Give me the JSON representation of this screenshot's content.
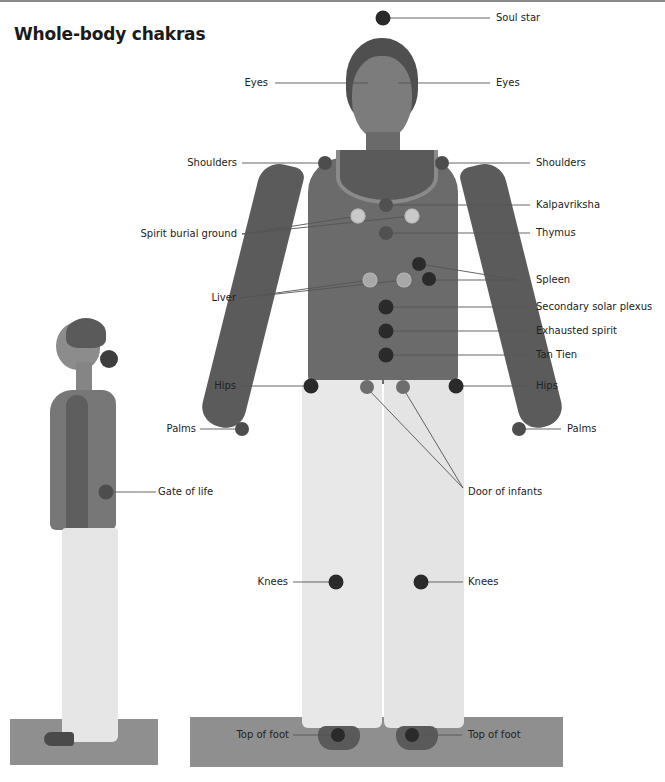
{
  "page": {
    "title": "Whole-body chakras"
  },
  "colors": {
    "dot_dark": "#2a2a2a",
    "dot_mid": "#4d4d4d",
    "dot_light": "#c9c9c9",
    "leader_line": "#555555",
    "mat": "#8f8f8f",
    "skin": "#5e5e5e",
    "top": "#6a6a6a",
    "trousers": "#e6e6e6"
  },
  "figures": {
    "front": "front-view-standing-woman",
    "side": "side-view-standing-woman"
  },
  "labels": {
    "soul_star": "Soul star",
    "eyes_left": "Eyes",
    "eyes_right": "Eyes",
    "shoulders_left": "Shoulders",
    "shoulders_right": "Shoulders",
    "kalpavriksha": "Kalpavriksha",
    "spirit_burial_ground": "Spirit burial ground",
    "thymus": "Thymus",
    "spleen": "Spleen",
    "liver": "Liver",
    "secondary_solar_plexus": "Secondary solar plexus",
    "exhausted_spirit": "Exhausted spirit",
    "tan_tien": "Tan Tien",
    "hips_left": "Hips",
    "hips_right": "Hips",
    "palms_left": "Palms",
    "palms_right": "Palms",
    "gate_of_life": "Gate of life",
    "door_of_infants": "Door of infants",
    "knees_left": "Knees",
    "knees_right": "Knees",
    "top_of_foot_left": "Top of foot",
    "top_of_foot_right": "Top of foot"
  }
}
